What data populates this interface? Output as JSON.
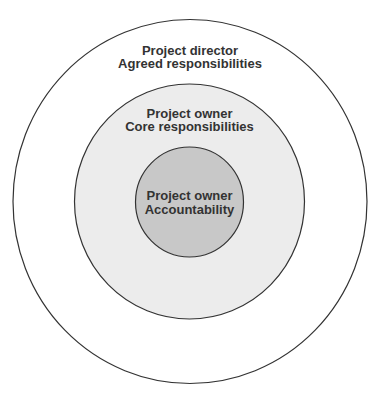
{
  "diagram": {
    "type": "concentric-circles",
    "colors": {
      "outer_fill": "#ffffff",
      "middle_fill": "#ececec",
      "inner_fill": "#c8c8c8",
      "stroke": "#333333",
      "text": "#333333"
    },
    "rings": [
      {
        "id": "outer",
        "line1": "Project director",
        "line2": "Agreed responsibilities"
      },
      {
        "id": "middle",
        "line1": "Project owner",
        "line2": "Core responsibilities"
      },
      {
        "id": "inner",
        "line1": "Project owner",
        "line2": "Accountability"
      }
    ]
  }
}
